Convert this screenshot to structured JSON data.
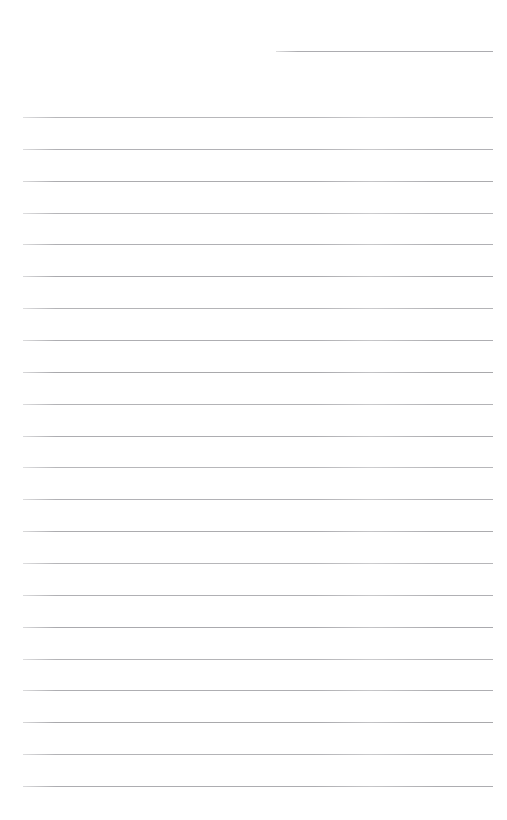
{
  "page": {
    "name": "blank-lined-page",
    "width": 507,
    "height": 820,
    "background_color": "#ffffff",
    "text_content": ""
  },
  "header_rule": {
    "name": "header-rule",
    "label": "",
    "x_start": 276,
    "x_end": 493,
    "y": 51,
    "color": "#a6a6aa",
    "thickness": 1
  },
  "ruled_lines": {
    "name": "ruled-writing-lines",
    "count": 22,
    "x_start": 23,
    "x_end": 493,
    "first_y": 117,
    "spacing": 31.85,
    "color": "#a8a8ac",
    "thickness": 1,
    "y_positions": [
      117,
      148.9,
      180.7,
      212.6,
      244.4,
      276.3,
      308.1,
      340,
      371.8,
      403.7,
      435.5,
      467.4,
      499.2,
      531.1,
      562.9,
      594.8,
      626.6,
      658.5,
      690.3,
      722.2,
      754,
      785.9
    ],
    "line_texts": [
      "",
      "",
      "",
      "",
      "",
      "",
      "",
      "",
      "",
      "",
      "",
      "",
      "",
      "",
      "",
      "",
      "",
      "",
      "",
      "",
      "",
      ""
    ]
  }
}
